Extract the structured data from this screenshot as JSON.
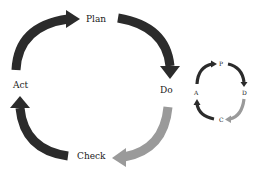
{
  "diagram": {
    "large_cycle": {
      "labels": {
        "plan": "Plan",
        "do": "Do",
        "check": "Check",
        "act": "Act"
      },
      "arrows": [
        {
          "from": "Act",
          "to": "Plan",
          "color": "#2b2b2b"
        },
        {
          "from": "Plan",
          "to": "Do",
          "color": "#2b2b2b"
        },
        {
          "from": "Do",
          "to": "Check",
          "color": "#9a9a9a"
        },
        {
          "from": "Check",
          "to": "Act",
          "color": "#2b2b2b"
        }
      ]
    },
    "small_cycle": {
      "labels": {
        "p": "P",
        "d": "D",
        "c": "C",
        "a": "A"
      },
      "arrows": [
        {
          "from": "A",
          "to": "P",
          "color": "#2b2b2b"
        },
        {
          "from": "P",
          "to": "D",
          "color": "#2b2b2b"
        },
        {
          "from": "D",
          "to": "C",
          "color": "#9a9a9a"
        },
        {
          "from": "C",
          "to": "A",
          "color": "#2b2b2b"
        }
      ]
    },
    "colors": {
      "dark_arrow": "#2b2b2b",
      "gray_arrow": "#9a9a9a",
      "text": "#1a1a1a",
      "background": "#ffffff"
    }
  }
}
